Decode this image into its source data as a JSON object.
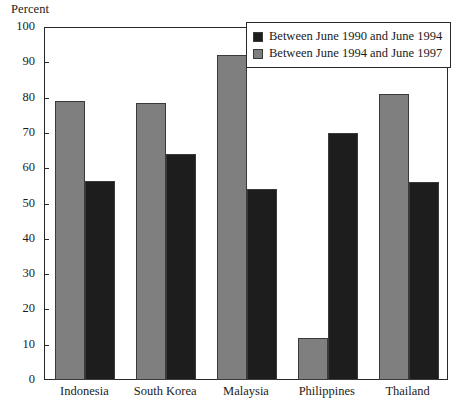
{
  "chart_data": {
    "type": "bar",
    "title": "",
    "subtitle": "",
    "ylabel": "Percent",
    "xlabel": "",
    "ylim": [
      0,
      100
    ],
    "yticks": [
      0,
      10,
      20,
      30,
      40,
      50,
      60,
      70,
      80,
      90,
      100
    ],
    "grid": false,
    "legend_position": "top-right",
    "categories": [
      "Indonesia",
      "South Korea",
      "Malaysia",
      "Philippines",
      "Thailand"
    ],
    "series": [
      {
        "name": "Between June 1990 and June 1994",
        "color": "#1d1d1d",
        "values": [
          56.5,
          64,
          54,
          70,
          56
        ]
      },
      {
        "name": "Between June 1994 and June 1997",
        "color": "#7f7f7f",
        "values": [
          79,
          78.5,
          92,
          12,
          81
        ]
      }
    ]
  },
  "legend": {
    "items": [
      {
        "label": "Between June 1990 and June 1994",
        "color": "#1d1d1d"
      },
      {
        "label": "Between June 1994 and June 1997",
        "color": "#7f7f7f"
      }
    ]
  },
  "axis": {
    "y_title": "Percent",
    "y_tick_labels": [
      "100",
      "90",
      "80",
      "70",
      "60",
      "50",
      "40",
      "30",
      "20",
      "10",
      "0"
    ],
    "x_tick_labels": [
      "Indonesia",
      "South Korea",
      "Malaysia",
      "Philippines",
      "Thailand"
    ]
  }
}
